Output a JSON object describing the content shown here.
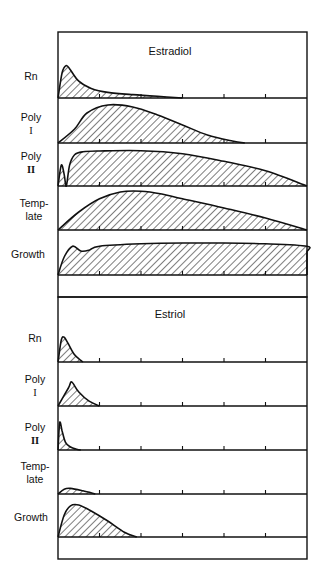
{
  "colors": {
    "ink": "#111111",
    "background": "#ffffff"
  },
  "chart_data": [
    {
      "type": "area",
      "title": "Estradiol",
      "xlabel": "",
      "ylabel": "",
      "x_ticks": [
        0,
        1,
        2,
        3,
        4,
        5,
        6
      ],
      "x_tick_labels": [],
      "grid": false,
      "fill_pattern": "diagonal-hatch",
      "series": [
        {
          "name": "Rn",
          "label_lines": [
            "Rn"
          ],
          "x": [
            0,
            0.1,
            0.2,
            0.3,
            0.5,
            0.8,
            1.2,
            1.8,
            2.4,
            3.0
          ],
          "y": [
            0,
            0.45,
            0.58,
            0.5,
            0.3,
            0.17,
            0.1,
            0.06,
            0.03,
            0
          ]
        },
        {
          "name": "Poly I",
          "label_lines": [
            "Poly",
            "I"
          ],
          "x": [
            0,
            0.4,
            0.7,
            1.2,
            1.8,
            2.4,
            3.0,
            3.6,
            4.2,
            4.5
          ],
          "y": [
            0,
            0.35,
            0.75,
            0.95,
            0.9,
            0.7,
            0.45,
            0.2,
            0.05,
            0
          ]
        },
        {
          "name": "Poly II",
          "label_lines": [
            "Poly",
            "II"
          ],
          "x": [
            0,
            0.08,
            0.15,
            0.2,
            0.28,
            0.4,
            0.6,
            1.0,
            2.0,
            3.0,
            4.0,
            5.0,
            6.3
          ],
          "y": [
            0,
            0.55,
            0.3,
            0.0,
            0.55,
            0.82,
            0.9,
            0.92,
            0.93,
            0.85,
            0.65,
            0.4,
            0
          ]
        },
        {
          "name": "Template",
          "label_lines": [
            "Temp-",
            "late"
          ],
          "x": [
            0,
            0.5,
            1.0,
            1.5,
            2.0,
            2.5,
            3.0,
            4.0,
            5.0,
            6.0
          ],
          "y": [
            0,
            0.45,
            0.78,
            0.95,
            0.97,
            0.9,
            0.78,
            0.55,
            0.3,
            0
          ]
        },
        {
          "name": "Growth",
          "label_lines": [
            "Growth"
          ],
          "x": [
            0,
            0.15,
            0.35,
            0.55,
            0.75,
            1.0,
            2.0,
            3.0,
            4.0,
            5.0,
            6.0,
            7.0,
            8.0,
            9.0
          ],
          "y": [
            0,
            0.45,
            0.72,
            0.6,
            0.62,
            0.72,
            0.78,
            0.8,
            0.8,
            0.78,
            0.72,
            0.58,
            0.35,
            0
          ]
        }
      ]
    },
    {
      "type": "area",
      "title": "Estriol",
      "xlabel": "",
      "ylabel": "",
      "x_ticks": [
        0,
        1,
        2,
        3,
        4,
        5,
        6
      ],
      "x_tick_labels": [],
      "grid": false,
      "fill_pattern": "diagonal-hatch",
      "series": [
        {
          "name": "Rn",
          "label_lines": [
            "Rn"
          ],
          "x": [
            0,
            0.08,
            0.15,
            0.25,
            0.4,
            0.55,
            0.6
          ],
          "y": [
            0,
            0.55,
            0.62,
            0.45,
            0.18,
            0.04,
            0
          ]
        },
        {
          "name": "Poly I",
          "label_lines": [
            "Poly",
            "I"
          ],
          "x": [
            0,
            0.25,
            0.33,
            0.5,
            0.75,
            1.0
          ],
          "y": [
            0,
            0.45,
            0.6,
            0.35,
            0.12,
            0
          ]
        },
        {
          "name": "Poly II",
          "label_lines": [
            "Poly",
            "II"
          ],
          "x": [
            0,
            0.04,
            0.1,
            0.18,
            0.3,
            0.45,
            0.55
          ],
          "y": [
            0,
            0.72,
            0.5,
            0.2,
            0.08,
            0.02,
            0
          ]
        },
        {
          "name": "Template",
          "label_lines": [
            "Temp-",
            "late"
          ],
          "x": [
            0,
            0.15,
            0.3,
            0.6,
            0.9
          ],
          "y": [
            0,
            0.12,
            0.14,
            0.08,
            0
          ]
        },
        {
          "name": "Growth",
          "label_lines": [
            "Growth"
          ],
          "x": [
            0,
            0.15,
            0.3,
            0.5,
            0.8,
            1.2,
            1.6,
            1.9
          ],
          "y": [
            0,
            0.55,
            0.78,
            0.8,
            0.65,
            0.4,
            0.12,
            0
          ]
        }
      ]
    }
  ],
  "panels": [
    {
      "title": "Estradiol",
      "rows": [
        {
          "label1": "Rn",
          "label2": ""
        },
        {
          "label1": "Poly",
          "label2": "I"
        },
        {
          "label1": "Poly",
          "label2": "II"
        },
        {
          "label1": "Temp-",
          "label2": "late"
        },
        {
          "label1": "Growth",
          "label2": ""
        }
      ]
    },
    {
      "title": "Estriol",
      "rows": [
        {
          "label1": "Rn",
          "label2": ""
        },
        {
          "label1": "Poly",
          "label2": "I"
        },
        {
          "label1": "Poly",
          "label2": "II"
        },
        {
          "label1": "Temp-",
          "label2": "late"
        },
        {
          "label1": "Growth",
          "label2": ""
        }
      ]
    }
  ]
}
